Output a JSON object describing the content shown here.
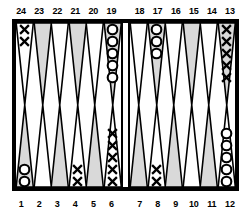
{
  "board": {
    "title": "Backgammon board diagram",
    "colors": {
      "border": "#000000",
      "background": "#ffffff",
      "point_shaded": "#d9d9d9",
      "point_plain": "#ffffff",
      "checker_dark": "#000000"
    },
    "checker_glyphs": {
      "X": "X",
      "O": "O"
    },
    "top_labels": [
      "24",
      "23",
      "22",
      "21",
      "20",
      "19",
      "18",
      "17",
      "16",
      "15",
      "14",
      "13"
    ],
    "bottom_labels": [
      "1",
      "2",
      "3",
      "4",
      "5",
      "6",
      "7",
      "8",
      "9",
      "10",
      "11",
      "12"
    ],
    "quadrants": {
      "top_left": [
        {
          "point": "24",
          "shaded": false,
          "checker": "X",
          "count": 2
        },
        {
          "point": "23",
          "shaded": true,
          "checker": null,
          "count": 0
        },
        {
          "point": "22",
          "shaded": false,
          "checker": null,
          "count": 0
        },
        {
          "point": "21",
          "shaded": true,
          "checker": null,
          "count": 0
        },
        {
          "point": "20",
          "shaded": false,
          "checker": null,
          "count": 0
        },
        {
          "point": "19",
          "shaded": true,
          "checker": "O",
          "count": 5
        }
      ],
      "top_right": [
        {
          "point": "18",
          "shaded": false,
          "checker": null,
          "count": 0
        },
        {
          "point": "17",
          "shaded": true,
          "checker": "O",
          "count": 3
        },
        {
          "point": "16",
          "shaded": false,
          "checker": null,
          "count": 0
        },
        {
          "point": "15",
          "shaded": true,
          "checker": null,
          "count": 0
        },
        {
          "point": "14",
          "shaded": false,
          "checker": null,
          "count": 0
        },
        {
          "point": "13",
          "shaded": true,
          "checker": "X",
          "count": 5
        }
      ],
      "bottom_left": [
        {
          "point": "1",
          "shaded": true,
          "checker": "O",
          "count": 2
        },
        {
          "point": "2",
          "shaded": false,
          "checker": null,
          "count": 0
        },
        {
          "point": "3",
          "shaded": true,
          "checker": null,
          "count": 0
        },
        {
          "point": "4",
          "shaded": false,
          "checker": "X",
          "count": 2
        },
        {
          "point": "5",
          "shaded": true,
          "checker": null,
          "count": 0
        },
        {
          "point": "6",
          "shaded": false,
          "checker": "X",
          "count": 5
        }
      ],
      "bottom_right": [
        {
          "point": "7",
          "shaded": true,
          "checker": null,
          "count": 0
        },
        {
          "point": "8",
          "shaded": false,
          "checker": "X",
          "count": 2
        },
        {
          "point": "9",
          "shaded": true,
          "checker": null,
          "count": 0
        },
        {
          "point": "10",
          "shaded": false,
          "checker": null,
          "count": 0
        },
        {
          "point": "11",
          "shaded": true,
          "checker": null,
          "count": 0
        },
        {
          "point": "12",
          "shaded": false,
          "checker": "O",
          "count": 5
        }
      ]
    }
  }
}
